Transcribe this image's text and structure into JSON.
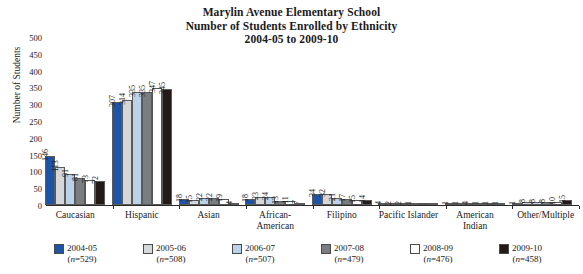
{
  "title": {
    "line1": "Marylin Avenue Elementary School",
    "line2": "Number of Students Enrolled by Ethnicity",
    "line3": "2004-05 to 2009-10"
  },
  "axis": {
    "ylabel": "Number of Students",
    "yticks": [
      "500",
      "450",
      "400",
      "350",
      "300",
      "250",
      "200",
      "150",
      "100",
      "50",
      "0"
    ]
  },
  "legend": [
    {
      "label": "2004-05",
      "n": "(n=529)",
      "color": "#1d54a6"
    },
    {
      "label": "2005-06",
      "n": "(n=508)",
      "color": "#d6d7d9"
    },
    {
      "label": "2006-07",
      "n": "(n=507)",
      "color": "#bcd2e8"
    },
    {
      "label": "2007-08",
      "n": "(n=479)",
      "color": "#7b7e81"
    },
    {
      "label": "2008-09",
      "n": "(n=476)",
      "color": "#ffffff"
    },
    {
      "label": "2009-10",
      "n": "(n=458)",
      "color": "#241b18"
    }
  ],
  "chart_data": {
    "type": "bar",
    "title": "Marylin Avenue Elementary School Number of Students Enrolled by Ethnicity 2004-05 to 2009-10",
    "xlabel": "",
    "ylabel": "Number of Students",
    "ylim": [
      0,
      500
    ],
    "ytick_step": 50,
    "grid": false,
    "legend_position": "bottom",
    "categories": [
      "Caucasian",
      "Hispanic",
      "Asian",
      "African-American",
      "Filipino",
      "Pacific Islander",
      "American Indian",
      "Other/Multiple"
    ],
    "series": [
      {
        "name": "2004-05",
        "values": [
          146,
          307,
          18,
          18,
          34,
          4,
          1,
          1
        ]
      },
      {
        "name": "2005-06",
        "values": [
          113,
          314,
          15,
          23,
          32,
          2,
          1,
          8
        ]
      },
      {
        "name": "2006-07",
        "values": [
          91,
          335,
          22,
          24,
          21,
          2,
          4,
          8
        ]
      },
      {
        "name": "2007-08",
        "values": [
          81,
          335,
          22,
          13,
          17,
          1,
          1,
          8
        ]
      },
      {
        "name": "2008-09",
        "values": [
          73,
          347,
          19,
          11,
          15,
          null,
          1,
          10
        ]
      },
      {
        "name": "2009-10",
        "values": [
          72,
          345,
          4,
          7,
          14,
          null,
          1,
          15
        ]
      }
    ]
  }
}
